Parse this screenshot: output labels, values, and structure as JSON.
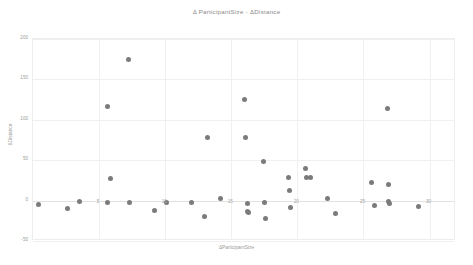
{
  "chart": {
    "title": "Δ ParticipantSize - ΔDistance",
    "xlabel": "ΔParticipantSize",
    "ylabel": "ΔDistance",
    "marker_color": "#7b7b7b",
    "grid_color": "#f0f0f0",
    "background": "#ffffff"
  },
  "chart_data": {
    "type": "scatter",
    "title": "Δ ParticipantSize - ΔDistance",
    "xlabel": "ΔParticipantSize",
    "ylabel": "ΔDistance",
    "xlim": [
      0,
      32
    ],
    "ylim": [
      -50,
      200
    ],
    "xticks": [
      5,
      10,
      15,
      20,
      25,
      30
    ],
    "yticks": [
      -50,
      0,
      50,
      100,
      150,
      200
    ],
    "xtick_labels": [
      "5",
      "10",
      "15",
      "20",
      "25",
      "30"
    ],
    "ytick_labels": [
      "-50",
      "0",
      "50",
      "100",
      "150",
      "200"
    ],
    "grid": true,
    "legend": false,
    "series": [
      {
        "name": "ΔDistance",
        "points": [
          [
            0.4,
            -5
          ],
          [
            2.6,
            -10
          ],
          [
            3.5,
            -1
          ],
          [
            5.6,
            117
          ],
          [
            5.6,
            -2
          ],
          [
            5.9,
            27
          ],
          [
            7.2,
            175
          ],
          [
            7.3,
            -2
          ],
          [
            9.2,
            -12
          ],
          [
            10.1,
            -2
          ],
          [
            12.0,
            -2
          ],
          [
            13.0,
            -20
          ],
          [
            13.2,
            78
          ],
          [
            14.2,
            2
          ],
          [
            16.0,
            125
          ],
          [
            16.1,
            78
          ],
          [
            16.2,
            -3
          ],
          [
            16.2,
            -14
          ],
          [
            16.3,
            -15
          ],
          [
            17.4,
            48
          ],
          [
            17.5,
            -2
          ],
          [
            17.6,
            -22
          ],
          [
            19.3,
            28
          ],
          [
            19.4,
            12
          ],
          [
            19.5,
            -9
          ],
          [
            20.6,
            40
          ],
          [
            20.7,
            28
          ],
          [
            21.0,
            28
          ],
          [
            22.3,
            2
          ],
          [
            22.9,
            -16
          ],
          [
            25.6,
            22
          ],
          [
            25.8,
            -6
          ],
          [
            26.8,
            114
          ],
          [
            26.9,
            20
          ],
          [
            26.9,
            -1
          ],
          [
            27.0,
            -3
          ],
          [
            29.2,
            -7
          ]
        ]
      }
    ]
  }
}
